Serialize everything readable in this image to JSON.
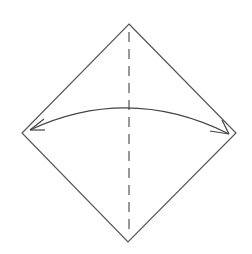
{
  "diagram": {
    "type": "origami-fold-instruction",
    "colors": {
      "background": "#ffffff",
      "stroke": "#555555"
    },
    "paper": {
      "shape": "diamond",
      "vertices": {
        "top": [
          129,
          24
        ],
        "right": [
          236,
          133
        ],
        "bottom": [
          128,
          242
        ],
        "left": [
          22,
          133
        ]
      }
    },
    "fold_line": {
      "style": "dashed",
      "kind": "valley-fold",
      "from": [
        129,
        32
      ],
      "to": [
        129,
        236
      ]
    },
    "arrow": {
      "kind": "curved-double-headed",
      "start": [
        30,
        130
      ],
      "peak": [
        129,
        107
      ],
      "end": [
        229,
        134
      ]
    }
  }
}
